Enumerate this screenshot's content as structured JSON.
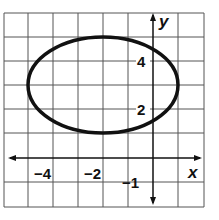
{
  "graph": {
    "x_range": [
      -6,
      2
    ],
    "y_range": [
      -2,
      6
    ],
    "grid_step": 1,
    "axis_labels": {
      "x": "x",
      "y": "y"
    },
    "tick_labels": [
      {
        "text": "−4",
        "axis": "x",
        "value": -4
      },
      {
        "text": "−2",
        "axis": "x",
        "value": -2
      },
      {
        "text": "−1",
        "axis": "y",
        "value": -1
      },
      {
        "text": "2",
        "axis": "y",
        "value": 2
      },
      {
        "text": "4",
        "axis": "y",
        "value": 4
      }
    ],
    "ellipse": {
      "center": [
        -2,
        3
      ],
      "rx": 3,
      "ry": 2
    },
    "colors": {
      "grid": "#555555",
      "curve": "#111111",
      "background": "#ffffff"
    }
  }
}
